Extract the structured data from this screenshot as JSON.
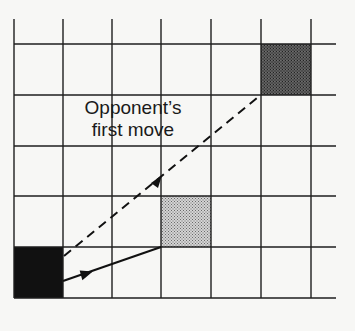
{
  "diagram": {
    "type": "game-board-move-diagram",
    "grid": {
      "columns": 6,
      "rows": 5,
      "vertical_lines_x": [
        14,
        63,
        112,
        161,
        211,
        261,
        311
      ],
      "horizontal_lines_y": [
        44,
        95,
        146,
        196,
        247,
        298
      ],
      "line_top": 19,
      "line_right": 336,
      "line_color": "#1e1e1e"
    },
    "squares": [
      {
        "name": "player-piece",
        "col": 0,
        "row": 4,
        "fill": "#111111",
        "pattern": "solid"
      },
      {
        "name": "player-move-target",
        "col": 3,
        "row": 3,
        "fill": "#b0b0b0",
        "pattern": "stipple-light"
      },
      {
        "name": "opponent-move-target",
        "col": 5,
        "row": 0,
        "fill": "#5a5a5a",
        "pattern": "stipple-dark"
      }
    ],
    "arrows": [
      {
        "name": "solid-move-arrow",
        "style": "solid",
        "from": [
          63,
          281
        ],
        "to": [
          161,
          247
        ],
        "arrow_at": [
          88,
          273
        ]
      },
      {
        "name": "dashed-opponent-arrow",
        "style": "dashed",
        "from": [
          63,
          257
        ],
        "to": [
          257,
          98
        ],
        "arrow_at": [
          161,
          177
        ]
      }
    ],
    "label": {
      "line1": "Opponent’s",
      "line2": "first move"
    }
  }
}
